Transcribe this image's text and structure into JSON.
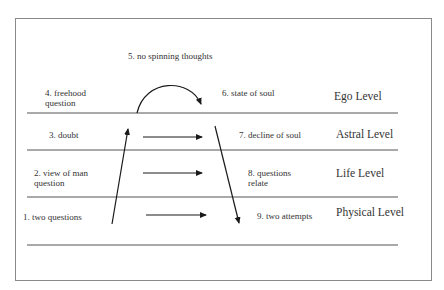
{
  "diagram": {
    "title_note": "5.  no spinning thoughts",
    "left_items": [
      {
        "line1": "4. freehood",
        "line2": "question"
      },
      {
        "line1": "3. doubt",
        "line2": ""
      },
      {
        "line1": "2. view of man",
        "line2": "question"
      },
      {
        "line1": "1. two questions",
        "line2": ""
      }
    ],
    "right_items": [
      {
        "line1": "6. state of soul",
        "line2": ""
      },
      {
        "line1": "7. decline of soul",
        "line2": ""
      },
      {
        "line1": "8. questions",
        "line2": "relate"
      },
      {
        "line1": "9. two attempts",
        "line2": ""
      }
    ],
    "levels": [
      {
        "label": "Ego Level"
      },
      {
        "label": "Astral Level"
      },
      {
        "label": "Life Level"
      },
      {
        "label": "Physical Level"
      }
    ],
    "colors": {
      "line": "#555555",
      "arrow": "#1a1a1a",
      "frame": "#8a8a8a",
      "text": "#333333"
    }
  }
}
